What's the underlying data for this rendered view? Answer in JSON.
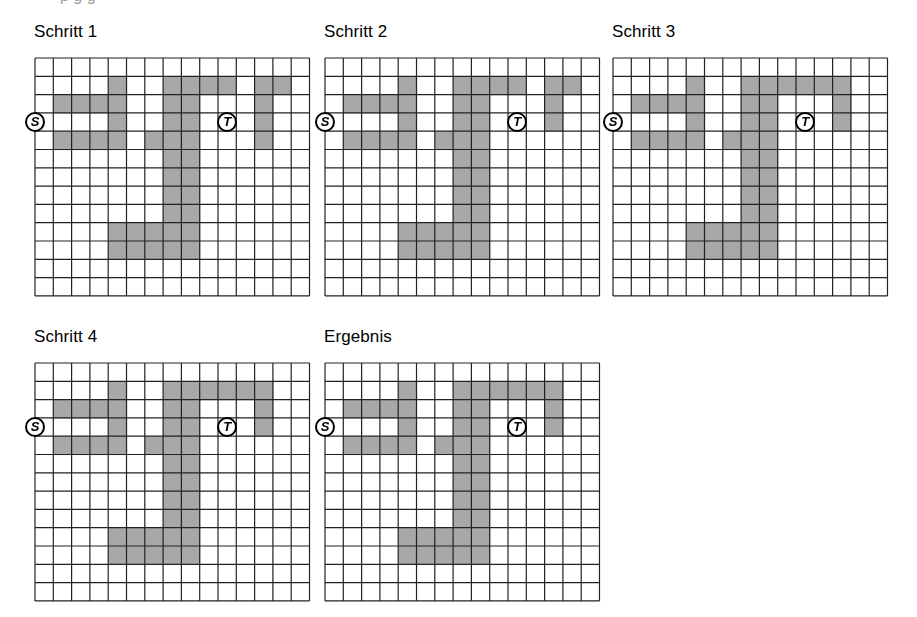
{
  "document": {
    "title": "Schritt-Diagramme: Pfadsuche im Raster",
    "clipped_header_text": "p g g",
    "background_color": "#ffffff",
    "ink_color": "#000000",
    "grid_line_color": "#222222",
    "cell_fill_color": "#a8a8a8",
    "cell_empty_color": "#ffffff"
  },
  "grid_spec": {
    "columns": 15,
    "rows": 13,
    "cell_size_px": 18.3,
    "line_width_px": 1.2,
    "start_label": "S",
    "target_label": "T",
    "start_cell": {
      "col": 0,
      "row": 3,
      "edge": "left"
    },
    "target_cell": {
      "col": 10,
      "row": 3
    }
  },
  "panels": [
    {
      "id": "schritt-1",
      "label": "Schritt 1",
      "left": 34,
      "title_top": 22,
      "grid_top": 57,
      "filled_cells": [
        [
          4,
          1
        ],
        [
          7,
          1
        ],
        [
          8,
          1
        ],
        [
          9,
          1
        ],
        [
          10,
          1
        ],
        [
          12,
          1
        ],
        [
          13,
          1
        ],
        [
          1,
          2
        ],
        [
          2,
          2
        ],
        [
          3,
          2
        ],
        [
          4,
          2
        ],
        [
          7,
          2
        ],
        [
          8,
          2
        ],
        [
          12,
          2
        ],
        [
          4,
          3
        ],
        [
          7,
          3
        ],
        [
          8,
          3
        ],
        [
          12,
          3
        ],
        [
          1,
          4
        ],
        [
          2,
          4
        ],
        [
          3,
          4
        ],
        [
          4,
          4
        ],
        [
          6,
          4
        ],
        [
          7,
          4
        ],
        [
          8,
          4
        ],
        [
          12,
          4
        ],
        [
          7,
          5
        ],
        [
          8,
          5
        ],
        [
          7,
          6
        ],
        [
          8,
          6
        ],
        [
          7,
          7
        ],
        [
          8,
          7
        ],
        [
          7,
          8
        ],
        [
          8,
          8
        ],
        [
          4,
          9
        ],
        [
          5,
          9
        ],
        [
          6,
          9
        ],
        [
          7,
          9
        ],
        [
          8,
          9
        ],
        [
          4,
          10
        ],
        [
          5,
          10
        ],
        [
          6,
          10
        ],
        [
          7,
          10
        ],
        [
          8,
          10
        ]
      ]
    },
    {
      "id": "schritt-2",
      "label": "Schritt 2",
      "left": 324,
      "title_top": 22,
      "grid_top": 57,
      "filled_cells": [
        [
          4,
          1
        ],
        [
          7,
          1
        ],
        [
          8,
          1
        ],
        [
          9,
          1
        ],
        [
          10,
          1
        ],
        [
          12,
          1
        ],
        [
          13,
          1
        ],
        [
          1,
          2
        ],
        [
          2,
          2
        ],
        [
          3,
          2
        ],
        [
          4,
          2
        ],
        [
          7,
          2
        ],
        [
          8,
          2
        ],
        [
          12,
          2
        ],
        [
          4,
          3
        ],
        [
          7,
          3
        ],
        [
          8,
          3
        ],
        [
          12,
          3
        ],
        [
          1,
          4
        ],
        [
          2,
          4
        ],
        [
          3,
          4
        ],
        [
          4,
          4
        ],
        [
          6,
          4
        ],
        [
          7,
          4
        ],
        [
          8,
          4
        ],
        [
          7,
          5
        ],
        [
          8,
          5
        ],
        [
          7,
          6
        ],
        [
          8,
          6
        ],
        [
          7,
          7
        ],
        [
          8,
          7
        ],
        [
          7,
          8
        ],
        [
          8,
          8
        ],
        [
          4,
          9
        ],
        [
          5,
          9
        ],
        [
          6,
          9
        ],
        [
          7,
          9
        ],
        [
          8,
          9
        ],
        [
          4,
          10
        ],
        [
          5,
          10
        ],
        [
          6,
          10
        ],
        [
          7,
          10
        ],
        [
          8,
          10
        ]
      ]
    },
    {
      "id": "schritt-3",
      "label": "Schritt 3",
      "left": 612,
      "title_top": 22,
      "grid_top": 57,
      "filled_cells": [
        [
          4,
          1
        ],
        [
          7,
          1
        ],
        [
          8,
          1
        ],
        [
          9,
          1
        ],
        [
          10,
          1
        ],
        [
          11,
          1
        ],
        [
          12,
          1
        ],
        [
          1,
          2
        ],
        [
          2,
          2
        ],
        [
          3,
          2
        ],
        [
          4,
          2
        ],
        [
          7,
          2
        ],
        [
          8,
          2
        ],
        [
          12,
          2
        ],
        [
          4,
          3
        ],
        [
          7,
          3
        ],
        [
          8,
          3
        ],
        [
          12,
          3
        ],
        [
          1,
          4
        ],
        [
          2,
          4
        ],
        [
          3,
          4
        ],
        [
          4,
          4
        ],
        [
          6,
          4
        ],
        [
          7,
          4
        ],
        [
          8,
          4
        ],
        [
          7,
          5
        ],
        [
          8,
          5
        ],
        [
          7,
          6
        ],
        [
          8,
          6
        ],
        [
          7,
          7
        ],
        [
          8,
          7
        ],
        [
          7,
          8
        ],
        [
          8,
          8
        ],
        [
          4,
          9
        ],
        [
          5,
          9
        ],
        [
          6,
          9
        ],
        [
          7,
          9
        ],
        [
          8,
          9
        ],
        [
          4,
          10
        ],
        [
          5,
          10
        ],
        [
          6,
          10
        ],
        [
          7,
          10
        ],
        [
          8,
          10
        ]
      ]
    },
    {
      "id": "schritt-4",
      "label": "Schritt 4",
      "left": 34,
      "title_top": 327,
      "grid_top": 362,
      "filled_cells": [
        [
          4,
          1
        ],
        [
          7,
          1
        ],
        [
          8,
          1
        ],
        [
          9,
          1
        ],
        [
          10,
          1
        ],
        [
          11,
          1
        ],
        [
          12,
          1
        ],
        [
          1,
          2
        ],
        [
          2,
          2
        ],
        [
          3,
          2
        ],
        [
          4,
          2
        ],
        [
          7,
          2
        ],
        [
          8,
          2
        ],
        [
          12,
          2
        ],
        [
          4,
          3
        ],
        [
          7,
          3
        ],
        [
          8,
          3
        ],
        [
          12,
          3
        ],
        [
          1,
          4
        ],
        [
          2,
          4
        ],
        [
          3,
          4
        ],
        [
          4,
          4
        ],
        [
          6,
          4
        ],
        [
          7,
          4
        ],
        [
          8,
          4
        ],
        [
          7,
          5
        ],
        [
          8,
          5
        ],
        [
          7,
          6
        ],
        [
          8,
          6
        ],
        [
          7,
          7
        ],
        [
          8,
          7
        ],
        [
          7,
          8
        ],
        [
          8,
          8
        ],
        [
          4,
          9
        ],
        [
          5,
          9
        ],
        [
          6,
          9
        ],
        [
          7,
          9
        ],
        [
          8,
          9
        ],
        [
          4,
          10
        ],
        [
          5,
          10
        ],
        [
          6,
          10
        ],
        [
          7,
          10
        ],
        [
          8,
          10
        ]
      ]
    },
    {
      "id": "ergebnis",
      "label": "Ergebnis",
      "left": 324,
      "title_top": 327,
      "grid_top": 362,
      "filled_cells": [
        [
          4,
          1
        ],
        [
          7,
          1
        ],
        [
          8,
          1
        ],
        [
          9,
          1
        ],
        [
          10,
          1
        ],
        [
          11,
          1
        ],
        [
          12,
          1
        ],
        [
          1,
          2
        ],
        [
          2,
          2
        ],
        [
          3,
          2
        ],
        [
          4,
          2
        ],
        [
          7,
          2
        ],
        [
          8,
          2
        ],
        [
          12,
          2
        ],
        [
          4,
          3
        ],
        [
          7,
          3
        ],
        [
          8,
          3
        ],
        [
          12,
          3
        ],
        [
          1,
          4
        ],
        [
          2,
          4
        ],
        [
          3,
          4
        ],
        [
          4,
          4
        ],
        [
          6,
          4
        ],
        [
          7,
          4
        ],
        [
          8,
          4
        ],
        [
          7,
          5
        ],
        [
          8,
          5
        ],
        [
          7,
          6
        ],
        [
          8,
          6
        ],
        [
          7,
          7
        ],
        [
          8,
          7
        ],
        [
          7,
          8
        ],
        [
          8,
          8
        ],
        [
          4,
          9
        ],
        [
          5,
          9
        ],
        [
          6,
          9
        ],
        [
          7,
          9
        ],
        [
          8,
          9
        ],
        [
          4,
          10
        ],
        [
          5,
          10
        ],
        [
          6,
          10
        ],
        [
          7,
          10
        ],
        [
          8,
          10
        ]
      ]
    }
  ]
}
